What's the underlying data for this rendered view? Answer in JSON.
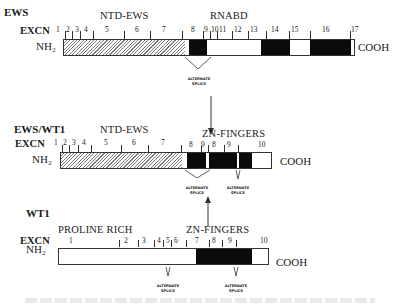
{
  "figure": {
    "panels": [
      {
        "name": "EWS",
        "excn_label": "EXCN",
        "n_terminus": "NH₂",
        "c_terminus": "COOH",
        "regions": [
          "NTD-EWS",
          "RNABD"
        ],
        "exons": [
          "1",
          "2",
          "3",
          "4",
          "5",
          "6",
          "7",
          "8",
          "9",
          "10",
          "11",
          "12",
          "13",
          "14",
          "15",
          "16",
          "17"
        ],
        "annotations": [
          "ALTERNATE",
          "SPLICE"
        ]
      },
      {
        "name": "EWS/WT1",
        "excn_label": "EXCN",
        "n_terminus": "NH₂",
        "c_terminus": "COOH",
        "regions": [
          "NTD-EWS",
          "ZN-FINGERS"
        ],
        "exons": [
          "1",
          "2",
          "3",
          "4",
          "5",
          "6",
          "7",
          "8",
          "9",
          "8",
          "9",
          "10"
        ],
        "annotations": [
          {
            "line1": "ALTERNATE",
            "line2": "SPLICE"
          },
          {
            "line1": "ALTERNATE",
            "line2": "SPLICE"
          }
        ]
      },
      {
        "name": "WT1",
        "excn_label": "EXCN",
        "n_terminus": "NH₂",
        "c_terminus": "COOH",
        "regions": [
          "PROLINE RICH",
          "ZN-FINGERS"
        ],
        "exons": [
          "1",
          "2",
          "3",
          "4",
          "5",
          "6",
          "7",
          "8",
          "9",
          "10"
        ],
        "annotations": [
          {
            "line1": "ALTERNATE",
            "line2": "SPLICE"
          },
          {
            "line1": "ALTERNATE",
            "line2": "SPLICE"
          }
        ]
      }
    ],
    "colors": {
      "ntd_hatch": "#7a7a7a",
      "domain_fill": "#0b0b0b",
      "outline": "#333333",
      "background": "#ffffff"
    }
  }
}
